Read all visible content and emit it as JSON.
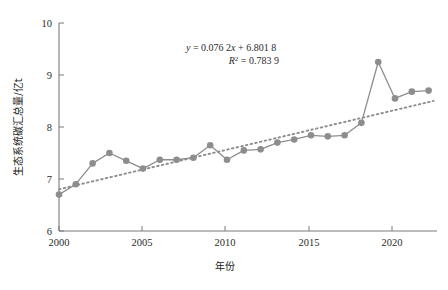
{
  "chart_data": {
    "type": "line",
    "title": "",
    "xlabel": "年份",
    "ylabel": "生态系统碳汇总量/亿t",
    "xlim": [
      2000,
      2022.5
    ],
    "ylim": [
      6,
      10
    ],
    "yticks": [
      6,
      7,
      8,
      9,
      10
    ],
    "xticks": [
      2000,
      2005,
      2010,
      2015,
      2020
    ],
    "grid": false,
    "legend": null,
    "x": [
      2000,
      2001,
      2002,
      2003,
      2004,
      2005,
      2006,
      2007,
      2008,
      2009,
      2010,
      2011,
      2012,
      2013,
      2014,
      2015,
      2016,
      2017,
      2018,
      2019,
      2020,
      2021,
      2022
    ],
    "series": [
      {
        "name": "生态系统碳汇总量",
        "marker": "circle",
        "color": "#8d8d8d",
        "values": [
          6.7,
          6.9,
          7.3,
          7.5,
          7.35,
          7.2,
          7.37,
          7.37,
          7.41,
          7.65,
          7.37,
          7.55,
          7.57,
          7.7,
          7.76,
          7.84,
          7.82,
          7.84,
          8.08,
          9.25,
          8.55,
          8.68,
          8.7
        ]
      }
    ],
    "trendline": {
      "name": "linear-trend",
      "style": "dotted",
      "color": "#8d8d8d",
      "slope": 0.0762,
      "intercept": 6.8018,
      "r_squared": 0.7839,
      "x_start": 2000,
      "x_end": 2022.3,
      "y_start": 6.8018,
      "y_end": 8.5013
    },
    "annotations": {
      "equation": "y = 0.076 2x + 6.801 8",
      "equation_parts": {
        "y_symbol": "y",
        "equals": " = 0.076 2",
        "x_symbol": "x",
        "tail": " + 6.801 8"
      },
      "r_squared_label": "R",
      "r_squared_sup": "2",
      "r_squared_value": " = 0.783 9"
    }
  },
  "axis": {
    "y_tick_labels": [
      "10",
      "9",
      "8",
      "7",
      "6"
    ],
    "x_tick_labels": [
      "2000",
      "2005",
      "2010",
      "2015",
      "2020"
    ],
    "y_axis_title": "生态系统碳汇总量/亿t",
    "x_axis_title": "年份"
  },
  "colors": {
    "series": "#8d8d8d",
    "axis": "#7a7a7a",
    "text": "#1a1a1a",
    "background": "#ffffff"
  }
}
